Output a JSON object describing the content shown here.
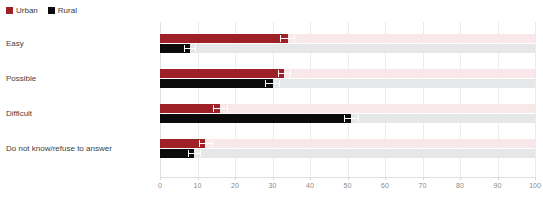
{
  "legend": {
    "position": "top-left",
    "items": [
      {
        "label": "Urban",
        "color": "#9e2128",
        "icon": "square-swatch"
      },
      {
        "label": "Rural",
        "color": "#0b0b0b",
        "icon": "square-swatch"
      }
    ]
  },
  "axis": {
    "ticks": [
      "0",
      "10",
      "20",
      "30",
      "40",
      "50",
      "60",
      "70",
      "80",
      "90",
      "100"
    ]
  },
  "chart_data": {
    "type": "bar",
    "orientation": "horizontal",
    "title": "",
    "subtitle": "",
    "xlabel": "",
    "ylabel": "",
    "xlim": [
      0,
      100
    ],
    "xticks": [
      0,
      10,
      20,
      30,
      40,
      50,
      60,
      70,
      80,
      90,
      100
    ],
    "grid": true,
    "legend_position": "top-left",
    "categories": [
      "Easy",
      "Possible",
      "Difficult",
      "Do not know/refuse to answer"
    ],
    "series": [
      {
        "name": "Urban",
        "color": "#9e2128",
        "track_color": "#f8e8ea",
        "values": [
          34,
          33,
          16,
          12
        ],
        "error_low": [
          32,
          31.5,
          14,
          10.5
        ],
        "error_high": [
          36,
          35,
          18,
          14
        ]
      },
      {
        "name": "Rural",
        "color": "#0b0b0b",
        "track_color": "#e5e7e9",
        "values": [
          8,
          30,
          51,
          9
        ],
        "error_low": [
          6.5,
          28,
          49,
          7.5
        ],
        "error_high": [
          9.5,
          32,
          53,
          11
        ]
      }
    ]
  }
}
